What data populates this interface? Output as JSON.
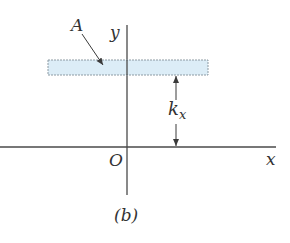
{
  "diagram": {
    "caption": "(b)",
    "labels": {
      "plate": "A",
      "y_axis": "y",
      "x_axis": "x",
      "origin": "O",
      "distance_main": "k",
      "distance_sub": "x"
    },
    "colors": {
      "axis": "#4a4a4a",
      "plate_fill": "#dcedf7",
      "plate_stroke": "#8c9aa3",
      "text": "#333333"
    }
  }
}
